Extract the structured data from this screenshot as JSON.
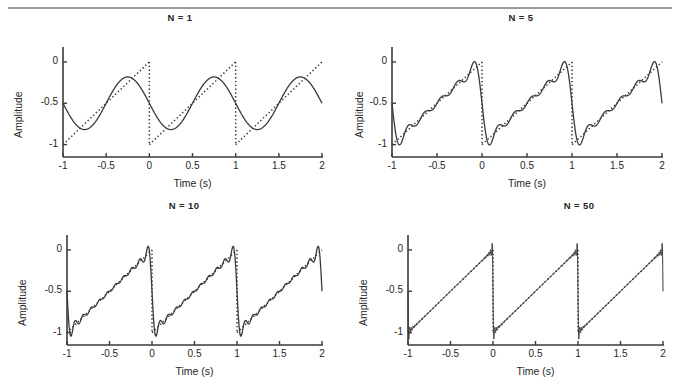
{
  "figure": {
    "background_color": "#ffffff",
    "line_color": "#3a3a3a",
    "rule_color": "#9a9a9a",
    "top_rule": true
  },
  "panels": [
    {
      "id": "n1",
      "title": "N = 1",
      "N": 1,
      "xlabel": "Time (s)",
      "ylabel": "Amplitude",
      "xticks": [
        "-1",
        "-0.5",
        "0",
        "0.5",
        "1",
        "1.5",
        "2"
      ],
      "xtick_values": [
        -1,
        -0.5,
        0,
        0.5,
        1,
        1.5,
        2
      ],
      "yticks": [
        "0",
        "-0.5",
        "-1"
      ],
      "ytick_values": [
        0,
        -0.5,
        -1
      ]
    },
    {
      "id": "n5",
      "title": "N = 5",
      "N": 5,
      "xlabel": "Time (s)",
      "ylabel": "Amplitude",
      "xticks": [
        "-1",
        "-0.5",
        "0",
        "0.5",
        "1",
        "1.5",
        "2"
      ],
      "xtick_values": [
        -1,
        -0.5,
        0,
        0.5,
        1,
        1.5,
        2
      ],
      "yticks": [
        "0",
        "-0.5",
        "-1"
      ],
      "ytick_values": [
        0,
        -0.5,
        -1
      ]
    },
    {
      "id": "n10",
      "title": "N = 10",
      "N": 10,
      "xlabel": "Time (s)",
      "ylabel": "Amplitude",
      "xticks": [
        "-1",
        "-0.5",
        "0",
        "0.5",
        "1",
        "1.5",
        "2"
      ],
      "xtick_values": [
        -1,
        -0.5,
        0,
        0.5,
        1,
        1.5,
        2
      ],
      "yticks": [
        "0",
        "-0.5",
        "-1"
      ],
      "ytick_values": [
        0,
        -0.5,
        -1
      ]
    },
    {
      "id": "n50",
      "title": "N = 50",
      "N": 50,
      "xlabel": "Time (s)",
      "ylabel": "Amplitude",
      "xticks": [
        "-1",
        "-0.5",
        "0",
        "0.5",
        "1",
        "1.5",
        "2"
      ],
      "xtick_values": [
        -1,
        -0.5,
        0,
        0.5,
        1,
        1.5,
        2
      ],
      "yticks": [
        "0",
        "-0.5",
        "-1"
      ],
      "ytick_values": [
        0,
        -0.5,
        -1
      ]
    }
  ],
  "chart_data": [
    {
      "type": "line",
      "title": "N = 1",
      "xlabel": "Time (s)",
      "ylabel": "Amplitude",
      "xlim": [
        -1,
        2
      ],
      "ylim": [
        -1.15,
        0.12
      ],
      "xticks": [
        -1,
        -0.5,
        0,
        0.5,
        1,
        1.5,
        2
      ],
      "yticks": [
        0,
        -0.5,
        -1
      ],
      "grid": false,
      "legend": "none",
      "series": [
        {
          "name": "sawtooth target",
          "style": "dotted",
          "description": "Descending-reset sawtooth: ramps linearly from -1 to 0 over each 1 s period, with vertical drops at t = 0 and t = 1",
          "period": 1,
          "amplitude_min": -1,
          "amplitude_max": 0,
          "breakpoints": [
            -1,
            0,
            1,
            2
          ]
        },
        {
          "name": "Fourier partial sum N=1",
          "style": "solid",
          "description": "Single-harmonic (fundamental) approximation; sinusoid of period 1 s centered at -0.5",
          "harmonics": 1,
          "offset": -0.5,
          "peak": -0.18,
          "trough": -0.82
        }
      ]
    },
    {
      "type": "line",
      "title": "N = 5",
      "xlabel": "Time (s)",
      "ylabel": "Amplitude",
      "xlim": [
        -1,
        2
      ],
      "ylim": [
        -1.15,
        0.12
      ],
      "xticks": [
        -1,
        -0.5,
        0,
        0.5,
        1,
        1.5,
        2
      ],
      "yticks": [
        0,
        -0.5,
        -1
      ],
      "grid": false,
      "legend": "none",
      "series": [
        {
          "name": "sawtooth target",
          "style": "dotted",
          "description": "Same sawtooth reference, period 1 s, range -1 to 0",
          "period": 1,
          "amplitude_min": -1,
          "amplitude_max": 0,
          "breakpoints": [
            -1,
            0,
            1,
            2
          ]
        },
        {
          "name": "Fourier partial sum N=5",
          "style": "solid",
          "description": "Five-harmonic partial sum: visible ripple along ramp with Gibbs overshoot near each discontinuity",
          "harmonics": 5,
          "offset": -0.5,
          "overshoot_high": 0.02,
          "overshoot_low": -1.05
        }
      ]
    },
    {
      "type": "line",
      "title": "N = 10",
      "xlabel": "Time (s)",
      "ylabel": "Amplitude",
      "xlim": [
        -1,
        2
      ],
      "ylim": [
        -1.15,
        0.12
      ],
      "xticks": [
        -1,
        -0.5,
        0,
        0.5,
        1,
        1.5,
        2
      ],
      "yticks": [
        0,
        -0.5,
        -1
      ],
      "grid": false,
      "legend": "none",
      "series": [
        {
          "name": "sawtooth target",
          "style": "dotted",
          "description": "Same sawtooth reference, period 1 s, range -1 to 0",
          "period": 1,
          "amplitude_min": -1,
          "amplitude_max": 0,
          "breakpoints": [
            -1,
            0,
            1,
            2
          ]
        },
        {
          "name": "Fourier partial sum N=10",
          "style": "solid",
          "description": "Ten-harmonic partial sum: smaller, faster ripple and narrower Gibbs spikes at the jumps",
          "harmonics": 10,
          "offset": -0.5,
          "overshoot_high": 0.04,
          "overshoot_low": -1.07
        }
      ]
    },
    {
      "type": "line",
      "title": "N = 50",
      "xlabel": "Time (s)",
      "ylabel": "Amplitude",
      "xlim": [
        -1,
        2
      ],
      "ylim": [
        -1.15,
        0.12
      ],
      "xticks": [
        -1,
        -0.5,
        0,
        0.5,
        1,
        1.5,
        2
      ],
      "yticks": [
        0,
        -0.5,
        -1
      ],
      "grid": false,
      "legend": "none",
      "series": [
        {
          "name": "sawtooth target",
          "style": "dotted",
          "description": "Same sawtooth reference, period 1 s, range -1 to 0",
          "period": 1,
          "amplitude_min": -1,
          "amplitude_max": 0,
          "breakpoints": [
            -1,
            0,
            1,
            2
          ]
        },
        {
          "name": "Fourier partial sum N=50",
          "style": "solid",
          "description": "Fifty-harmonic partial sum: essentially coincides with the sawtooth; only very thin Gibbs spikes remain at t = 0, 1, 2",
          "harmonics": 50,
          "offset": -0.5,
          "overshoot_high": 0.05,
          "overshoot_low": -1.08
        }
      ]
    }
  ]
}
